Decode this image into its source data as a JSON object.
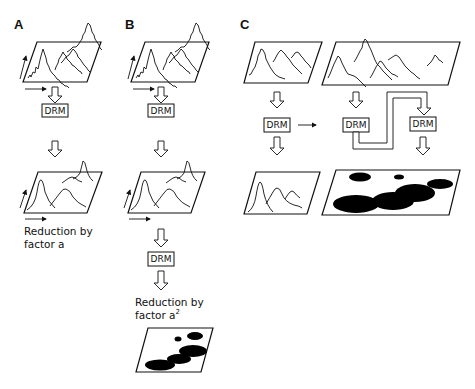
{
  "figure": {
    "panels": [
      {
        "id": "A",
        "label": "A",
        "drm_label": "DRM",
        "caption_line1": "Reduction by",
        "caption_line2": "factor a"
      },
      {
        "id": "B",
        "label": "B",
        "drm_label_1": "DRM",
        "drm_label_2": "DRM",
        "caption_line1": "Reduction by",
        "caption_line2": "factor a",
        "caption_superscript": "2"
      },
      {
        "id": "C",
        "label": "C",
        "drm_label_1": "DRM",
        "drm_label_2": "DRM",
        "drm_label_3": "DRM"
      }
    ],
    "colors": {
      "ink": "#111111",
      "background": "#ffffff"
    }
  }
}
